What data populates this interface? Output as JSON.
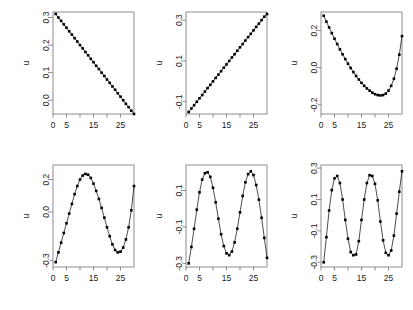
{
  "figure": {
    "layout": {
      "rows": 2,
      "cols": 3,
      "width": 413,
      "height": 310
    },
    "background": "#ffffff",
    "marker_color": "#000000",
    "line_color": "#000000",
    "axis_color": "#808080"
  },
  "chart_data": [
    {
      "id": "panel-1",
      "type": "scatter",
      "title": "",
      "xlabel": "",
      "ylabel": "u",
      "xlim": [
        0,
        30
      ],
      "ylim": [
        -0.05,
        0.32
      ],
      "grid": false,
      "legend": null,
      "x_ticks": [
        0,
        5,
        10,
        15,
        20,
        25
      ],
      "x_tick_labels": [
        "0",
        "5",
        "",
        "15",
        "",
        "25"
      ],
      "y_ticks": [
        0.0,
        0.1,
        0.2,
        0.3
      ],
      "y_tick_labels": [
        "0.0",
        "0.1",
        "0.2",
        "0.3"
      ],
      "x": [
        1,
        2,
        3,
        4,
        5,
        6,
        7,
        8,
        9,
        10,
        11,
        12,
        13,
        14,
        15,
        16,
        17,
        18,
        19,
        20,
        21,
        22,
        23,
        24,
        25,
        26,
        27,
        28,
        29,
        30
      ],
      "y": [
        0.313,
        0.3,
        0.288,
        0.275,
        0.263,
        0.25,
        0.238,
        0.225,
        0.213,
        0.2,
        0.188,
        0.175,
        0.163,
        0.15,
        0.138,
        0.125,
        0.113,
        0.1,
        0.088,
        0.075,
        0.063,
        0.05,
        0.038,
        0.025,
        0.013,
        0.0,
        -0.013,
        -0.025,
        -0.038,
        -0.05
      ]
    },
    {
      "id": "panel-2",
      "type": "scatter",
      "title": "",
      "xlabel": "",
      "ylabel": "u",
      "xlim": [
        0,
        30
      ],
      "ylim": [
        -0.16,
        0.34
      ],
      "grid": false,
      "legend": null,
      "x_ticks": [
        0,
        5,
        10,
        15,
        20,
        25
      ],
      "x_tick_labels": [
        "0",
        "5",
        "",
        "15",
        "",
        "25"
      ],
      "y_ticks": [
        -0.1,
        0.1,
        0.3
      ],
      "y_tick_labels": [
        "-0.1",
        "0.1",
        "0.3"
      ],
      "x": [
        1,
        2,
        3,
        4,
        5,
        6,
        7,
        8,
        9,
        10,
        11,
        12,
        13,
        14,
        15,
        16,
        17,
        18,
        19,
        20,
        21,
        22,
        23,
        24,
        25,
        26,
        27,
        28,
        29,
        30
      ],
      "y": [
        -0.15,
        -0.133,
        -0.117,
        -0.1,
        -0.083,
        -0.067,
        -0.05,
        -0.033,
        -0.017,
        0.0,
        0.017,
        0.033,
        0.05,
        0.067,
        0.083,
        0.1,
        0.117,
        0.133,
        0.15,
        0.167,
        0.183,
        0.2,
        0.217,
        0.233,
        0.25,
        0.267,
        0.283,
        0.3,
        0.317,
        0.33
      ]
    },
    {
      "id": "panel-3",
      "type": "scatter",
      "title": "",
      "xlabel": "",
      "ylabel": "u",
      "xlim": [
        0,
        30
      ],
      "ylim": [
        -0.25,
        0.3
      ],
      "grid": false,
      "legend": null,
      "x_ticks": [
        0,
        5,
        10,
        15,
        20,
        25
      ],
      "x_tick_labels": [
        "0",
        "5",
        "",
        "15",
        "",
        "25"
      ],
      "y_ticks": [
        -0.2,
        0.0,
        0.2
      ],
      "y_tick_labels": [
        "-0.2",
        "0.0",
        "0.2"
      ],
      "x": [
        1,
        2,
        3,
        4,
        5,
        6,
        7,
        8,
        9,
        10,
        11,
        12,
        13,
        14,
        15,
        16,
        17,
        18,
        19,
        20,
        21,
        22,
        23,
        24,
        25,
        26,
        27,
        28,
        29,
        30
      ],
      "y": [
        0.28,
        0.248,
        0.217,
        0.186,
        0.156,
        0.127,
        0.099,
        0.072,
        0.046,
        0.021,
        -0.002,
        -0.024,
        -0.045,
        -0.064,
        -0.082,
        -0.098,
        -0.112,
        -0.124,
        -0.135,
        -0.143,
        -0.148,
        -0.15,
        -0.148,
        -0.14,
        -0.124,
        -0.098,
        -0.06,
        -0.006,
        0.07,
        0.17
      ]
    },
    {
      "id": "panel-4",
      "type": "scatter",
      "title": "",
      "xlabel": "",
      "ylabel": "u",
      "xlim": [
        0,
        30
      ],
      "ylim": [
        -0.34,
        0.29
      ],
      "grid": false,
      "legend": null,
      "x_ticks": [
        0,
        5,
        10,
        15,
        20,
        25
      ],
      "x_tick_labels": [
        "0",
        "5",
        "",
        "15",
        "",
        "25"
      ],
      "y_ticks": [
        -0.3,
        0.0,
        0.2
      ],
      "y_tick_labels": [
        "-0.3",
        "0.0",
        "0.2"
      ],
      "x": [
        1,
        2,
        3,
        4,
        5,
        6,
        7,
        8,
        9,
        10,
        11,
        12,
        13,
        14,
        15,
        16,
        17,
        18,
        19,
        20,
        21,
        22,
        23,
        24,
        25,
        26,
        27,
        28,
        29,
        30
      ],
      "y": [
        -0.31,
        -0.25,
        -0.19,
        -0.13,
        -0.07,
        -0.01,
        0.05,
        0.11,
        0.16,
        0.2,
        0.225,
        0.235,
        0.23,
        0.21,
        0.175,
        0.13,
        0.08,
        0.025,
        -0.035,
        -0.095,
        -0.15,
        -0.2,
        -0.235,
        -0.25,
        -0.245,
        -0.22,
        -0.17,
        -0.095,
        0.01,
        0.16
      ]
    },
    {
      "id": "panel-5",
      "type": "scatter",
      "title": "",
      "xlabel": "",
      "ylabel": "u",
      "xlim": [
        0,
        30
      ],
      "ylim": [
        -0.32,
        0.24
      ],
      "grid": false,
      "legend": null,
      "x_ticks": [
        0,
        5,
        10,
        15,
        20,
        25
      ],
      "x_tick_labels": [
        "0",
        "5",
        "",
        "15",
        "",
        "25"
      ],
      "y_ticks": [
        -0.3,
        -0.1,
        0.1
      ],
      "y_tick_labels": [
        "-0.3",
        "-0.1",
        "0.1"
      ],
      "x": [
        1,
        2,
        3,
        4,
        5,
        6,
        7,
        8,
        9,
        10,
        11,
        12,
        13,
        14,
        15,
        16,
        17,
        18,
        19,
        20,
        21,
        22,
        23,
        24,
        25,
        26,
        27,
        28,
        29,
        30
      ],
      "y": [
        -0.3,
        -0.21,
        -0.11,
        -0.005,
        0.09,
        0.16,
        0.195,
        0.2,
        0.175,
        0.115,
        0.035,
        -0.055,
        -0.14,
        -0.205,
        -0.245,
        -0.255,
        -0.235,
        -0.185,
        -0.11,
        -0.02,
        0.07,
        0.145,
        0.19,
        0.205,
        0.185,
        0.13,
        0.05,
        -0.05,
        -0.16,
        -0.27
      ]
    },
    {
      "id": "panel-6",
      "type": "scatter",
      "title": "",
      "xlabel": "",
      "ylabel": "u",
      "xlim": [
        0,
        30
      ],
      "ylim": [
        -0.33,
        0.32
      ],
      "grid": false,
      "legend": null,
      "x_ticks": [
        0,
        5,
        10,
        15,
        20,
        25
      ],
      "x_tick_labels": [
        "0",
        "5",
        "",
        "15",
        "",
        "25"
      ],
      "y_ticks": [
        -0.3,
        -0.1,
        0.1,
        0.3
      ],
      "y_tick_labels": [
        "-0.3",
        "-0.1",
        "0.1",
        "0.3"
      ],
      "x": [
        1,
        2,
        3,
        4,
        5,
        6,
        7,
        8,
        9,
        10,
        11,
        12,
        13,
        14,
        15,
        16,
        17,
        18,
        19,
        20,
        21,
        22,
        23,
        24,
        25,
        26,
        27,
        28,
        29,
        30
      ],
      "y": [
        -0.3,
        -0.14,
        0.03,
        0.16,
        0.235,
        0.25,
        0.205,
        0.1,
        -0.03,
        -0.15,
        -0.235,
        -0.255,
        -0.25,
        -0.165,
        -0.03,
        0.1,
        0.205,
        0.255,
        0.25,
        0.2,
        0.095,
        -0.04,
        -0.16,
        -0.24,
        -0.255,
        -0.225,
        -0.13,
        0.01,
        0.15,
        0.28
      ]
    }
  ]
}
